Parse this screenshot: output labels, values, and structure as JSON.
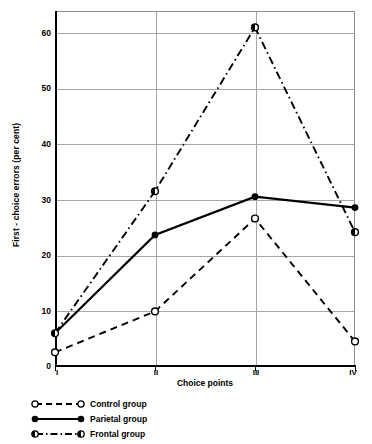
{
  "chart_data": {
    "type": "line",
    "title": "",
    "xlabel": "Choice points",
    "ylabel": "First - choice errors (per cent)",
    "categories": [
      "I",
      "II",
      "III",
      "IV"
    ],
    "ylim": [
      0,
      65
    ],
    "yticks": [
      0,
      10,
      20,
      30,
      40,
      50,
      60
    ],
    "ytick_labels": [
      "0",
      "10",
      "20",
      "30",
      "40",
      "50",
      "60"
    ],
    "grid": "horizontal gridlines at each y tick; vertical gridlines at choice points II and III",
    "legend_position": "below plot, lower left",
    "series": [
      {
        "name": "Control group",
        "values": [
          2.5,
          10,
          27,
          4.5
        ],
        "line_style": "dashed",
        "marker": "open-circle",
        "color": "#000000"
      },
      {
        "name": "Parietal group",
        "values": [
          6,
          24,
          31,
          29
        ],
        "line_style": "solid",
        "marker": "filled-circle",
        "color": "#000000"
      },
      {
        "name": "Frontal group",
        "values": [
          6,
          32,
          62,
          24.5
        ],
        "line_style": "dash-dot",
        "marker": "half-filled-circle",
        "color": "#000000"
      }
    ]
  },
  "axis": {
    "y_title": "First - choice errors (per cent)",
    "x_title": "Choice points",
    "y_tick_labels": [
      "60",
      "50",
      "40",
      "30",
      "20",
      "10",
      "0"
    ],
    "x_tick_labels": [
      "I",
      "II",
      "III",
      "IV"
    ]
  },
  "legend": {
    "items": [
      {
        "label": "Control group",
        "style": "dashed",
        "marker": "open-circle"
      },
      {
        "label": "Parietal group",
        "style": "solid",
        "marker": "filled-circle"
      },
      {
        "label": "Frontal group",
        "style": "dash-dot",
        "marker": "half-filled-circle"
      }
    ]
  }
}
